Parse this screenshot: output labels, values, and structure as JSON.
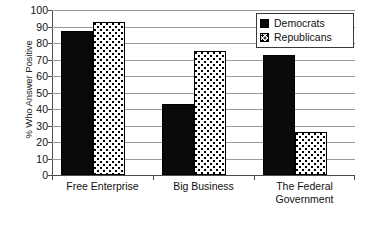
{
  "chart_data": {
    "type": "bar",
    "title": "",
    "subtitle": "",
    "xlabel": "",
    "ylabel": "% Who Answer Positive",
    "categories": [
      "Free Enterprise",
      "Big Business",
      "The Federal Government"
    ],
    "category_lines": [
      [
        "Free Enterprise"
      ],
      [
        "Big Business"
      ],
      [
        "The Federal",
        "Government"
      ]
    ],
    "series": [
      {
        "name": "Democrats",
        "values": [
          87,
          43,
          73
        ],
        "color": "#000000",
        "fill": "solid"
      },
      {
        "name": "Republicans",
        "values": [
          93,
          75,
          26
        ],
        "color": "#ffffff",
        "fill": "dotted"
      }
    ],
    "ylim": [
      0,
      100
    ],
    "ytick_step": 10,
    "yticks": [
      100,
      90,
      80,
      70,
      60,
      50,
      40,
      30,
      20,
      10,
      0
    ],
    "ytick_labels": [
      "100",
      "90",
      "80",
      "70",
      "60",
      "50",
      "40",
      "30",
      "20",
      "10",
      "0"
    ],
    "grid": true,
    "grid_axis": "y",
    "legend_position": "top-right",
    "legend": [
      "Democrats",
      "Republicans"
    ]
  },
  "legend": {
    "items": [
      {
        "label": "Democrats",
        "swatch": "solid-black-square-icon"
      },
      {
        "label": "Republicans",
        "swatch": "dotted-square-icon"
      }
    ]
  }
}
